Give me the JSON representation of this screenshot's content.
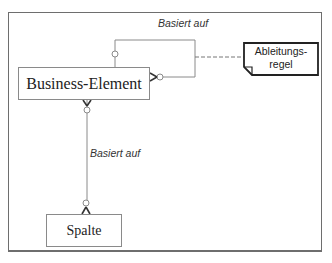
{
  "diagram": {
    "type": "er-diagram",
    "entities": [
      {
        "id": "business-element",
        "label": "Business-Element"
      },
      {
        "id": "spalte",
        "label": "Spalte"
      }
    ],
    "relationships": [
      {
        "from": "business-element",
        "to": "business-element",
        "label": "Basiert auf",
        "type": "self-reference",
        "cardinality": "zero-to-one to zero-to-many"
      },
      {
        "from": "business-element",
        "to": "spalte",
        "label": "Basiert auf",
        "cardinality": "zero-to-many to zero-to-many"
      }
    ],
    "note": {
      "line1": "Ableitungs-",
      "line2": "regel",
      "attached_to": "self-reference relationship"
    },
    "labels": {
      "self_relation": "Basiert auf",
      "spalte_relation": "Basiert auf"
    },
    "colors": {
      "line": "#8a8a8a",
      "frame": "#6e6e6e",
      "note_border": "#222222",
      "text": "#222222"
    }
  }
}
